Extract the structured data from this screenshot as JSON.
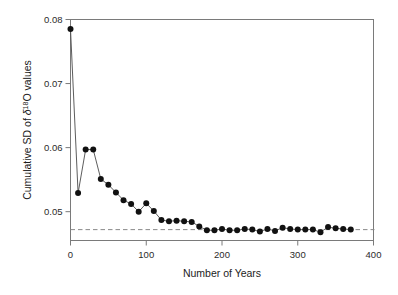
{
  "figure": {
    "background_color": "#ffffff",
    "frame_color": "#7a7a7a",
    "marker_color": "#111111",
    "line_color": "#4b4b4b",
    "refline_color": "#8a8a8a"
  },
  "axes": {
    "x_title": "Number of Years",
    "y_title_prefix": "Cumulative SD of ",
    "y_title_delta": "δ",
    "y_title_sup": "18",
    "y_title_suffix": "O values",
    "x_tick_labels": [
      "0",
      "100",
      "200",
      "300",
      "400"
    ],
    "y_tick_labels": [
      "0.05",
      "0.06",
      "0.07",
      "0.08"
    ]
  },
  "chart_data": {
    "type": "scatter",
    "title": "",
    "xlabel": "Number of Years",
    "ylabel": "Cumulative SD of δ18O values",
    "xlim": [
      0,
      400
    ],
    "ylim": [
      0.0455,
      0.08
    ],
    "xticks": [
      0,
      100,
      200,
      300,
      400
    ],
    "yticks": [
      0.05,
      0.06,
      0.07,
      0.08
    ],
    "grid": false,
    "legend": null,
    "marker": "filled-circle",
    "connected": true,
    "x": [
      0,
      10,
      20,
      30,
      40,
      50,
      60,
      70,
      80,
      90,
      100,
      110,
      120,
      130,
      140,
      150,
      160,
      170,
      180,
      190,
      200,
      210,
      220,
      230,
      240,
      250,
      260,
      270,
      280,
      290,
      300,
      310,
      320,
      330,
      340,
      350,
      360,
      370
    ],
    "y": [
      0.0785,
      0.0529,
      0.0597,
      0.0597,
      0.0551,
      0.0542,
      0.053,
      0.0518,
      0.0512,
      0.05,
      0.0513,
      0.0501,
      0.0487,
      0.0485,
      0.0486,
      0.0485,
      0.0484,
      0.0477,
      0.0471,
      0.0471,
      0.0473,
      0.0471,
      0.0471,
      0.0473,
      0.0472,
      0.0469,
      0.0473,
      0.047,
      0.0475,
      0.0473,
      0.0472,
      0.0472,
      0.0472,
      0.0468,
      0.0476,
      0.0474,
      0.0473,
      0.0472
    ],
    "reference_line": {
      "orientation": "horizontal",
      "value": 0.0472,
      "style": "dashed"
    }
  }
}
